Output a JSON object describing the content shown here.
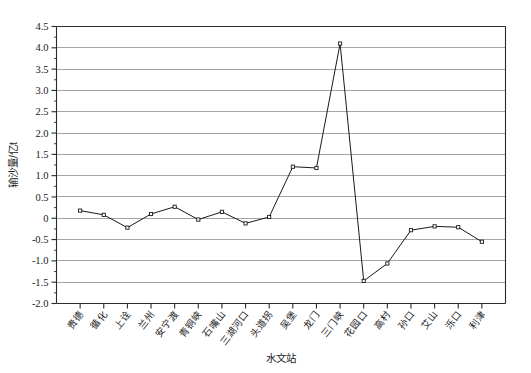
{
  "chart_data": {
    "type": "line",
    "title": "",
    "xlabel": "水文站",
    "ylabel": "输沙量/亿t",
    "ylim": [
      -2.0,
      4.5
    ],
    "ytick_labels": [
      "4.5",
      "4.0",
      "3.5",
      "3.0",
      "2.5",
      "2.0",
      "1.5",
      "1.0",
      "0.5",
      "0",
      "-0.5",
      "-1.0",
      "-1.5",
      "-2.0"
    ],
    "ytick_values": [
      4.5,
      4.0,
      3.5,
      3.0,
      2.5,
      2.0,
      1.5,
      1.0,
      0.5,
      0,
      -0.5,
      -1.0,
      -1.5,
      -2.0
    ],
    "grid": true,
    "legend_position": "none",
    "marker": "open-square",
    "categories": [
      "贵德",
      "循化",
      "上诠",
      "兰州",
      "安宁渡",
      "青铜峡",
      "石嘴山",
      "三湖河口",
      "头道拐",
      "吴堡",
      "龙门",
      "三门峡",
      "花园口",
      "高村",
      "孙口",
      "艾山",
      "泺口",
      "利津"
    ],
    "values": [
      0.18,
      0.08,
      -0.22,
      0.1,
      0.27,
      -0.03,
      0.15,
      -0.12,
      0.03,
      1.21,
      1.18,
      4.1,
      -1.47,
      -1.06,
      -0.28,
      -0.19,
      -0.21,
      -0.55
    ],
    "series": [
      {
        "name": "输沙量",
        "values": [
          0.18,
          0.08,
          -0.22,
          0.1,
          0.27,
          -0.03,
          0.15,
          -0.12,
          0.03,
          1.21,
          1.18,
          4.1,
          -1.47,
          -1.06,
          -0.28,
          -0.19,
          -0.21,
          -0.55
        ]
      }
    ]
  }
}
